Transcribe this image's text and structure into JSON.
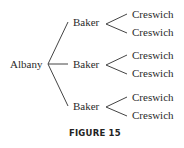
{
  "root": {
    "label": "Albany"
  },
  "level1": [
    {
      "label": "Baker",
      "children": [
        "Creswich",
        "Creswich"
      ]
    },
    {
      "label": "Baker",
      "children": [
        "Creswich",
        "Creswich"
      ]
    },
    {
      "label": "Baker",
      "children": [
        "Creswich",
        "Creswich"
      ]
    }
  ],
  "caption": "FIGURE 15"
}
